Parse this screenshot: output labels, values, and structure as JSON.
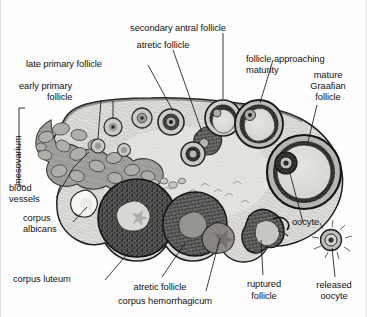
{
  "figure": {
    "type": "labeled-anatomical-diagram"
  },
  "labels": {
    "secondary_antral_follicle": "secondary antral follicle",
    "atretic_follicle_top": "atretic follicle",
    "late_primary_follicle": "late primary follicle",
    "early_primary_follicle_l1": "early primary",
    "early_primary_follicle_l2": "follicle",
    "follicle_approaching_l1": "follicle approaching",
    "follicle_approaching_l2": "maturity",
    "mature_graafian_l1": "mature",
    "mature_graafian_l2": "Graafian",
    "mature_graafian_l3": "follicle",
    "mesovarium": "mesovarium",
    "blood_vessels_l1": "blood",
    "blood_vessels_l2": "vessels",
    "corpus_albicans_l1": "corpus",
    "corpus_albicans_l2": "albicans",
    "corpus_luteum": "corpus luteum",
    "atretic_follicle_bottom": "atretic follicle",
    "corpus_hemorrhagicum": "corpus hemorrhagicum",
    "ruptured_follicle_l1": "ruptured",
    "ruptured_follicle_l2": "follicle",
    "oocyte": "oocyte",
    "released_oocyte_l1": "released",
    "released_oocyte_l2": "oocyte"
  },
  "colors": {
    "ink": "#1b1b1b",
    "background": "#fefefe",
    "stroma": "#d8d7d4",
    "cortex_light": "#e9e8e5",
    "follicle_antrum": "#dcdbd6",
    "follicle_wall": "#3a3a3a",
    "corpus_luteum": "#4a4a4a",
    "corpus_albicans": "#f7f7f5",
    "blood_vessel": "#9a9895",
    "capsule": "#2a2a2a"
  },
  "structures": [
    {
      "name": "mesovarium",
      "note": "hilum region with blood vessels, left side"
    },
    {
      "name": "blood vessels",
      "note": "clustered rounded vessel profiles in hilum"
    },
    {
      "name": "early primary follicle",
      "note": "small follicles in outer cortex"
    },
    {
      "name": "late primary follicle",
      "note": "larger follicle with thick granulosa"
    },
    {
      "name": "secondary antral follicle",
      "note": "follicle with forming antrum"
    },
    {
      "name": "atretic follicle",
      "note": "degenerating follicles, upper and lower"
    },
    {
      "name": "follicle approaching maturity",
      "note": "large antral follicle upper right"
    },
    {
      "name": "mature Graafian follicle",
      "note": "largest follicle, right edge, with oocyte"
    },
    {
      "name": "oocyte",
      "note": "cumulus-enclosed oocyte within Graafian follicle"
    },
    {
      "name": "released oocyte",
      "note": "ovulated oocyte with corona radiata, outside ovary"
    },
    {
      "name": "ruptured follicle",
      "note": "collapsed follicle at ovulation site"
    },
    {
      "name": "corpus hemorrhagicum",
      "note": "blood-filled follicle after ovulation"
    },
    {
      "name": "corpus luteum",
      "note": "large dark body, lower left"
    },
    {
      "name": "corpus albicans",
      "note": "pale scar, left lower margin"
    }
  ]
}
